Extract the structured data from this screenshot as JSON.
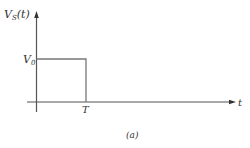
{
  "diagram": {
    "y_label": "V",
    "y_label_sub": "S",
    "y_label_arg": "(t)",
    "x_label": "t",
    "level_label": "V",
    "level_label_sub": "0",
    "time_mark": "T",
    "caption": "(a)",
    "colors": {
      "axis": "#555555",
      "pulse": "#777777",
      "text": "#333333"
    }
  }
}
